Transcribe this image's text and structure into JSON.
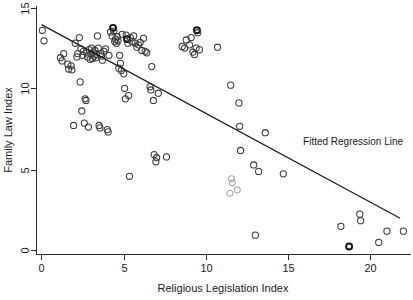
{
  "chart_data": {
    "type": "scatter",
    "title": "",
    "xlabel": "Religious Legislation Index",
    "ylabel": "Family Law Index",
    "xlim": [
      -0.6,
      22.6
    ],
    "ylim": [
      -0.4,
      15.4
    ],
    "xticks": [
      0,
      5,
      10,
      15,
      20
    ],
    "xticklabels": [
      "0",
      "5",
      "10",
      "15",
      "20"
    ],
    "yticks": [
      0,
      5,
      10,
      15
    ],
    "yticklabels": [
      "0",
      "5",
      "10",
      "15"
    ],
    "grid": false,
    "legend_position": "none",
    "annotations": [
      {
        "text": "Fitted Regression Line",
        "x": 15.9,
        "y": 6.55
      }
    ],
    "series": [
      {
        "name": "Countries",
        "marker": "open-circle",
        "color": "#3a3a3a",
        "points": [
          [
            0.05,
            13.65
          ],
          [
            0.15,
            13.0
          ],
          [
            1.15,
            11.95
          ],
          [
            1.25,
            11.75
          ],
          [
            1.35,
            12.2
          ],
          [
            1.6,
            11.55
          ],
          [
            1.65,
            11.25
          ],
          [
            1.8,
            11.45
          ],
          [
            1.85,
            11.2
          ],
          [
            1.95,
            7.75
          ],
          [
            2.05,
            12.85
          ],
          [
            2.15,
            12.0
          ],
          [
            2.2,
            12.2
          ],
          [
            2.3,
            13.2
          ],
          [
            2.35,
            10.45
          ],
          [
            2.4,
            12.5
          ],
          [
            2.45,
            8.65
          ],
          [
            2.5,
            12.1
          ],
          [
            2.55,
            12.35
          ],
          [
            2.6,
            7.9
          ],
          [
            2.65,
            9.4
          ],
          [
            2.7,
            9.3
          ],
          [
            2.75,
            12.25
          ],
          [
            2.8,
            12.0
          ],
          [
            2.85,
            7.65
          ],
          [
            2.9,
            12.45
          ],
          [
            2.95,
            11.85
          ],
          [
            3.0,
            12.2
          ],
          [
            3.05,
            12.55
          ],
          [
            3.1,
            11.9
          ],
          [
            3.15,
            12.3
          ],
          [
            3.2,
            12.05
          ],
          [
            3.25,
            12.4
          ],
          [
            3.3,
            11.95
          ],
          [
            3.35,
            12.15
          ],
          [
            3.4,
            13.3
          ],
          [
            3.45,
            12.55
          ],
          [
            3.5,
            7.75
          ],
          [
            3.55,
            7.6
          ],
          [
            3.6,
            12.2
          ],
          [
            3.65,
            12.05
          ],
          [
            3.7,
            11.8
          ],
          [
            3.8,
            12.35
          ],
          [
            3.9,
            12.5
          ],
          [
            4.0,
            7.5
          ],
          [
            4.05,
            7.35
          ],
          [
            4.1,
            12.1
          ],
          [
            4.2,
            13.55
          ],
          [
            4.3,
            13.3
          ],
          [
            4.35,
            13.8
          ],
          [
            4.4,
            13.6
          ],
          [
            4.45,
            12.95
          ],
          [
            4.5,
            13.1
          ],
          [
            4.55,
            12.85
          ],
          [
            4.6,
            13.25
          ],
          [
            4.65,
            13.0
          ],
          [
            4.7,
            11.3
          ],
          [
            4.75,
            12.1
          ],
          [
            4.8,
            11.6
          ],
          [
            4.85,
            11.15
          ],
          [
            4.9,
            13.4
          ],
          [
            5.0,
            10.95
          ],
          [
            5.05,
            10.05
          ],
          [
            5.1,
            9.4
          ],
          [
            5.15,
            13.35
          ],
          [
            5.2,
            13.1
          ],
          [
            5.25,
            12.85
          ],
          [
            5.3,
            9.6
          ],
          [
            5.35,
            4.6
          ],
          [
            5.4,
            13.2
          ],
          [
            5.5,
            12.95
          ],
          [
            5.6,
            13.3
          ],
          [
            5.7,
            12.85
          ],
          [
            5.8,
            12.6
          ],
          [
            5.9,
            12.75
          ],
          [
            6.0,
            12.9
          ],
          [
            6.1,
            12.4
          ],
          [
            6.2,
            13.15
          ],
          [
            6.3,
            12.35
          ],
          [
            6.4,
            12.25
          ],
          [
            6.6,
            10.15
          ],
          [
            6.65,
            9.95
          ],
          [
            6.7,
            11.4
          ],
          [
            6.8,
            9.3
          ],
          [
            6.85,
            5.95
          ],
          [
            6.95,
            5.5
          ],
          [
            7.0,
            5.75
          ],
          [
            7.1,
            9.75
          ],
          [
            7.6,
            5.8
          ],
          [
            8.55,
            12.65
          ],
          [
            8.7,
            12.55
          ],
          [
            8.8,
            13.05
          ],
          [
            9.0,
            12.75
          ],
          [
            9.1,
            13.2
          ],
          [
            9.2,
            12.3
          ],
          [
            9.3,
            12.15
          ],
          [
            9.4,
            12.55
          ],
          [
            9.45,
            13.65
          ],
          [
            9.5,
            13.5
          ],
          [
            9.6,
            12.45
          ],
          [
            10.7,
            12.6
          ],
          [
            11.5,
            10.25
          ],
          [
            11.55,
            4.45
          ],
          [
            11.6,
            4.2
          ],
          [
            11.45,
            3.55
          ],
          [
            11.9,
            3.75
          ],
          [
            12.0,
            9.15
          ],
          [
            12.05,
            7.7
          ],
          [
            12.1,
            6.2
          ],
          [
            12.9,
            5.3
          ],
          [
            13.0,
            0.95
          ],
          [
            13.2,
            4.9
          ],
          [
            13.6,
            7.3
          ],
          [
            14.7,
            4.75
          ],
          [
            18.2,
            1.5
          ],
          [
            18.7,
            0.25
          ],
          [
            19.35,
            2.25
          ],
          [
            19.4,
            1.85
          ],
          [
            20.5,
            0.5
          ],
          [
            21.0,
            1.2
          ],
          [
            22.0,
            1.2
          ]
        ]
      }
    ],
    "fit_line": {
      "name": "Fitted Regression Line",
      "x_start": 0.0,
      "y_start": 14.0,
      "x_end": 21.8,
      "y_end": 2.0,
      "color": "#1a1a1a"
    }
  },
  "axes": {
    "x_axis_name": "Religious Legislation Index",
    "y_axis_name": "Family Law Index"
  }
}
